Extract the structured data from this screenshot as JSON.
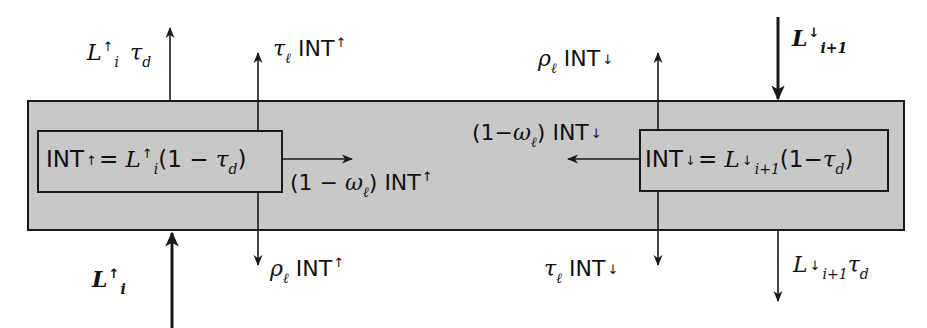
{
  "diagram": {
    "colors": {
      "layer_fill": "#c8c8c8",
      "stroke": "#1a1a1a",
      "background": "#ffffff"
    },
    "layer": {
      "label": "cloud layer"
    },
    "left_box": {
      "lhs": "INT",
      "lhs_arrow": "↑",
      "eq": "=",
      "L": "L",
      "L_arrow": "↑",
      "L_sub": "i",
      "rhs_open": "(1 − ",
      "tau": "τ",
      "tau_sub": "d",
      "rhs_close": ")"
    },
    "right_box": {
      "lhs": "INT",
      "lhs_arrow": "↓",
      "eq": "=",
      "L": "L",
      "L_arrow": "↓",
      "L_sub": "i+1",
      "rhs_open": "(1−",
      "tau": "τ",
      "tau_sub": "d",
      "rhs_close": ")"
    },
    "labels": {
      "top_left": {
        "L": "L",
        "arrow": "↑",
        "sub": "i",
        "tau": "τ",
        "tau_sub": "d"
      },
      "top_mid_left": {
        "tau": "τ",
        "tau_sub": "ℓ",
        "text": "INT",
        "arrow": "↑"
      },
      "top_mid_right": {
        "rho": "ρ",
        "rho_sub": "ℓ",
        "text": "INT",
        "arrow": "↓"
      },
      "top_right": {
        "L": "L",
        "arrow": "↓",
        "sub": "i+1"
      },
      "mid_left": {
        "open": "(1 − ",
        "omega": "ω",
        "omega_sub": "ℓ",
        "close": ") ",
        "text": "INT",
        "arrow": "↑"
      },
      "mid_right": {
        "open": "(1−",
        "omega": "ω",
        "omega_sub": "ℓ",
        "close": ") ",
        "text": "INT",
        "arrow": "↓"
      },
      "bottom_left": {
        "L": "L",
        "arrow": "↑",
        "sub": "i"
      },
      "bottom_mid_left": {
        "rho": "ρ",
        "rho_sub": "ℓ",
        "text": "INT",
        "arrow": "↑"
      },
      "bottom_mid_right": {
        "tau": "τ",
        "tau_sub": "ℓ",
        "text": "INT",
        "arrow": "↓"
      },
      "bottom_right": {
        "L": "L",
        "arrow": "↓",
        "sub": "i+1",
        "tau": "τ",
        "tau_sub": "d"
      }
    }
  }
}
